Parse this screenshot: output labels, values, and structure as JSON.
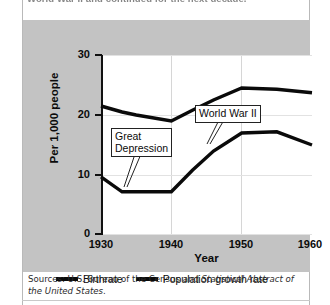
{
  "caption": {
    "text": "World War II and continued for the next decade."
  },
  "legend": {
    "position": "below-plot",
    "items": [
      {
        "label": "Birthrate",
        "color": "#0a0a0a"
      },
      {
        "label": "Population growth rate",
        "color": "#0a0a0a"
      }
    ]
  },
  "annotations": [
    {
      "name": "great-depression",
      "text": "Great\nDepression"
    },
    {
      "name": "world-war-ii",
      "text": "World War II"
    }
  ],
  "source": {
    "prefix": "Sources: U.S. Bureau of the Census and ",
    "italic": "Statistical Abstract of the United States",
    "suffix": "."
  },
  "chart_data": {
    "type": "line",
    "title": "",
    "xlabel": "Year",
    "ylabel": "Per 1,000 people",
    "x": [
      1930,
      1933,
      1935,
      1940,
      1943,
      1946,
      1950,
      1955,
      1960
    ],
    "xlim": [
      1930,
      1960
    ],
    "ylim": [
      0,
      30
    ],
    "xticks": [
      1930,
      1940,
      1950,
      1960
    ],
    "yticks": [
      0,
      10,
      20,
      30
    ],
    "grid": "both",
    "series": [
      {
        "name": "Birthrate",
        "color": "#0a0a0a",
        "values": [
          21.5,
          20.5,
          20.0,
          19.0,
          20.8,
          22.5,
          24.5,
          24.3,
          23.7
        ]
      },
      {
        "name": "Population growth rate",
        "color": "#0a0a0a",
        "values": [
          9.7,
          7.2,
          7.2,
          7.2,
          10.8,
          14.0,
          17.0,
          17.2,
          15.0
        ]
      }
    ]
  }
}
